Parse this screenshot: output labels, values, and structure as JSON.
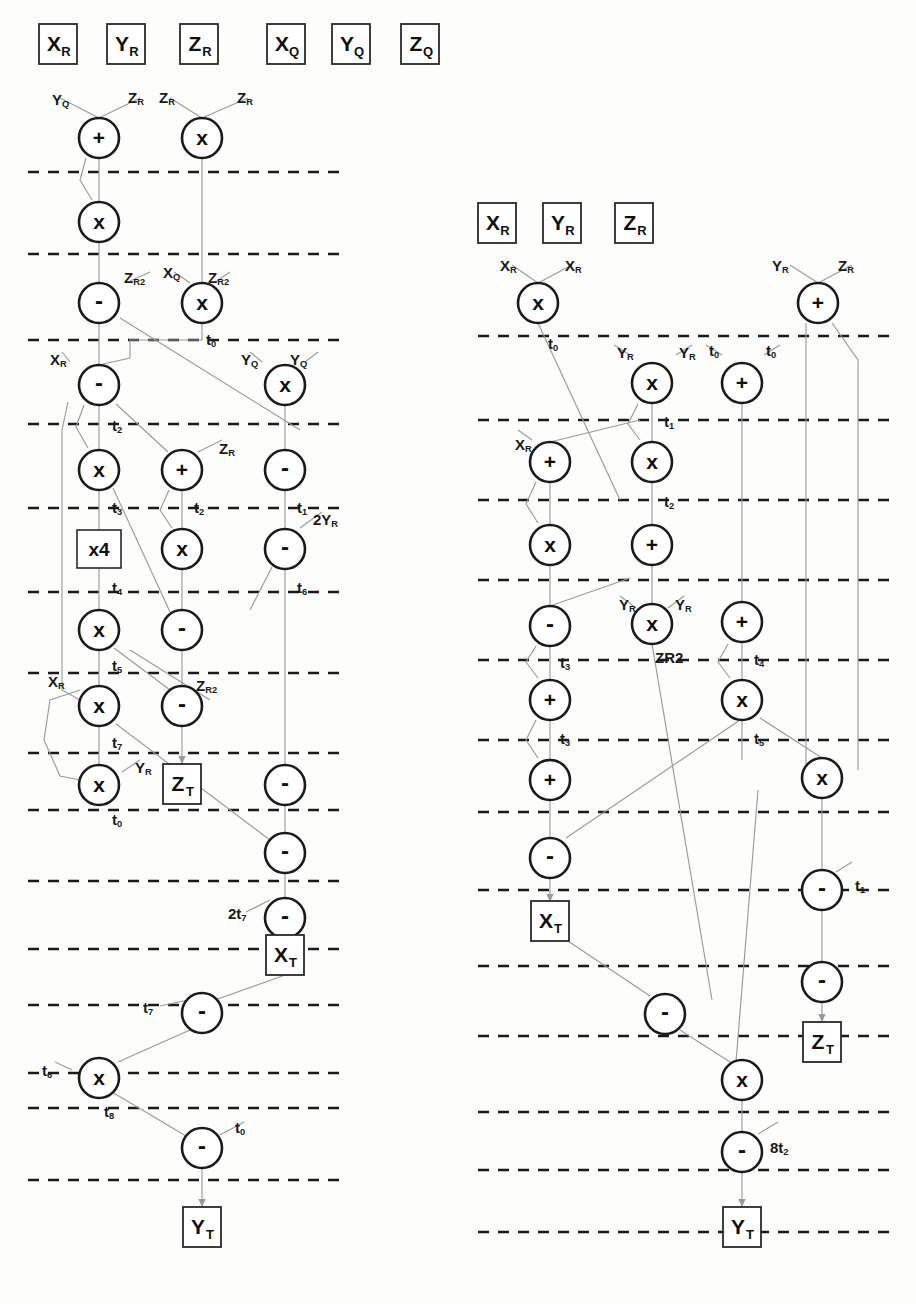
{
  "meta": {
    "colors": {
      "ink": "#1a1a1a",
      "wire": "#8a8a8a",
      "dash": "#1a1a1a",
      "paper": "#fdfdfc"
    }
  },
  "operators": {
    "add": "+",
    "mul": "x",
    "sub": "-",
    "times4": "x4"
  },
  "left_diagram": {
    "name": "left-dataflow-graph",
    "input_registers": [
      {
        "id": "L-in-XR",
        "label": "X",
        "sub": "R",
        "cx": 58,
        "cy": 44
      },
      {
        "id": "L-in-YR",
        "label": "Y",
        "sub": "R",
        "cx": 126,
        "cy": 44
      },
      {
        "id": "L-in-ZR",
        "label": "Z",
        "sub": "R",
        "cx": 199,
        "cy": 44
      },
      {
        "id": "L-in-XQ",
        "label": "X",
        "sub": "Q",
        "cx": 286,
        "cy": 44
      },
      {
        "id": "L-in-YQ",
        "label": "Y",
        "sub": "Q",
        "cx": 351,
        "cy": 44
      },
      {
        "id": "L-in-ZQ",
        "label": "Z",
        "sub": "Q",
        "cx": 420,
        "cy": 44
      }
    ],
    "dashed_rows": [
      172,
      254,
      340,
      424,
      508,
      592,
      673,
      753,
      810,
      881,
      949,
      1005,
      1073,
      1108,
      1180
    ],
    "dash_x0": 28,
    "dash_x1": 345,
    "nodes": [
      {
        "id": "L1",
        "op": "+",
        "cx": 99,
        "cy": 138
      },
      {
        "id": "L2",
        "op": "x",
        "cx": 202,
        "cy": 138
      },
      {
        "id": "L3",
        "op": "x",
        "cx": 99,
        "cy": 222
      },
      {
        "id": "L4",
        "op": "-",
        "cx": 99,
        "cy": 303
      },
      {
        "id": "L5",
        "op": "x",
        "cx": 202,
        "cy": 303
      },
      {
        "id": "L6",
        "op": "-",
        "cx": 99,
        "cy": 385
      },
      {
        "id": "L7",
        "op": "x",
        "cx": 285,
        "cy": 385
      },
      {
        "id": "L8",
        "op": "x",
        "cx": 99,
        "cy": 470
      },
      {
        "id": "L9",
        "op": "+",
        "cx": 182,
        "cy": 470
      },
      {
        "id": "L10",
        "op": "-",
        "cx": 285,
        "cy": 470
      },
      {
        "id": "L11",
        "op": "x4",
        "cx": 99,
        "cy": 549,
        "shape": "box"
      },
      {
        "id": "L12",
        "op": "x",
        "cx": 182,
        "cy": 549
      },
      {
        "id": "L13",
        "op": "-",
        "cx": 285,
        "cy": 549
      },
      {
        "id": "L14",
        "op": "x",
        "cx": 99,
        "cy": 630
      },
      {
        "id": "L15",
        "op": "-",
        "cx": 182,
        "cy": 630
      },
      {
        "id": "L16",
        "op": "x",
        "cx": 99,
        "cy": 706
      },
      {
        "id": "L17",
        "op": "-",
        "cx": 182,
        "cy": 706
      },
      {
        "id": "L18",
        "op": "x",
        "cx": 99,
        "cy": 785
      },
      {
        "id": "L19",
        "op": "-",
        "cx": 285,
        "cy": 785
      },
      {
        "id": "L20",
        "op": "-",
        "cx": 285,
        "cy": 853
      },
      {
        "id": "L21",
        "op": "-",
        "cx": 285,
        "cy": 918
      },
      {
        "id": "L22",
        "op": "-",
        "cx": 202,
        "cy": 1013
      },
      {
        "id": "L23",
        "op": "x",
        "cx": 99,
        "cy": 1078
      },
      {
        "id": "L24",
        "op": "-",
        "cx": 202,
        "cy": 1148
      }
    ],
    "output_registers": [
      {
        "id": "L-out-ZT",
        "label": "Z",
        "sub": "T",
        "cx": 182,
        "cy": 784
      },
      {
        "id": "L-out-XT",
        "label": "X",
        "sub": "T",
        "cx": 285,
        "cy": 955
      },
      {
        "id": "L-out-YT",
        "label": "Y",
        "sub": "T",
        "cx": 202,
        "cy": 1227
      }
    ],
    "wire_labels": [
      {
        "text": "Y",
        "sub": "Q",
        "x": 52,
        "y": 92
      },
      {
        "text": "Z",
        "sub": "R",
        "x": 128,
        "y": 90
      },
      {
        "text": "Z",
        "sub": "R",
        "x": 159,
        "y": 90
      },
      {
        "text": "Z",
        "sub": "R",
        "x": 237,
        "y": 90
      },
      {
        "text": "Z",
        "sub": "R2",
        "x": 124,
        "y": 270
      },
      {
        "text": "X",
        "sub": "Q",
        "x": 163,
        "y": 265
      },
      {
        "text": "Z",
        "sub": "R2",
        "x": 208,
        "y": 270
      },
      {
        "text": "t",
        "sub": "0",
        "x": 206,
        "y": 332
      },
      {
        "text": "X",
        "sub": "R",
        "x": 50,
        "y": 352
      },
      {
        "text": "Y",
        "sub": "Q",
        "x": 241,
        "y": 352
      },
      {
        "text": "Y",
        "sub": "Q",
        "x": 290,
        "y": 352
      },
      {
        "text": "t",
        "sub": "2",
        "x": 112,
        "y": 418
      },
      {
        "text": "Z",
        "sub": "R",
        "x": 219,
        "y": 441
      },
      {
        "text": "t",
        "sub": "3",
        "x": 112,
        "y": 500
      },
      {
        "text": "t",
        "sub": "2",
        "x": 194,
        "y": 500
      },
      {
        "text": "t",
        "sub": "1",
        "x": 297,
        "y": 500
      },
      {
        "text": "2Y",
        "sub": "R",
        "x": 313,
        "y": 512
      },
      {
        "text": "t",
        "sub": "4",
        "x": 112,
        "y": 580
      },
      {
        "text": "t",
        "sub": "6",
        "x": 297,
        "y": 580
      },
      {
        "text": "t",
        "sub": "5",
        "x": 112,
        "y": 658
      },
      {
        "text": "X",
        "sub": "R",
        "x": 48,
        "y": 674
      },
      {
        "text": "Z",
        "sub": "R2",
        "x": 196,
        "y": 678
      },
      {
        "text": "t",
        "sub": "7",
        "x": 112,
        "y": 735
      },
      {
        "text": "Y",
        "sub": "R",
        "x": 135,
        "y": 760
      },
      {
        "text": "t",
        "sub": "0",
        "x": 112,
        "y": 812
      },
      {
        "text": "2t",
        "sub": "7",
        "x": 228,
        "y": 906
      },
      {
        "text": "t",
        "sub": "7",
        "x": 143,
        "y": 1000
      },
      {
        "text": "t",
        "sub": "6",
        "x": 42,
        "y": 1063
      },
      {
        "text": "t",
        "sub": "8",
        "x": 104,
        "y": 1104
      },
      {
        "text": "t",
        "sub": "0",
        "x": 235,
        "y": 1120
      }
    ]
  },
  "right_diagram": {
    "name": "right-dataflow-graph",
    "input_registers": [
      {
        "id": "R-in-XR",
        "label": "X",
        "sub": "R",
        "cx": 497,
        "cy": 223
      },
      {
        "id": "R-in-YR",
        "label": "Y",
        "sub": "R",
        "cx": 562,
        "cy": 223
      },
      {
        "id": "R-in-ZR",
        "label": "Z",
        "sub": "R",
        "cx": 634,
        "cy": 223
      }
    ],
    "dashed_rows": [
      336,
      420,
      500,
      580,
      660,
      740,
      812,
      890,
      966,
      1036,
      1112,
      1170,
      1232
    ],
    "dash_x0": 478,
    "dash_x1": 892,
    "nodes": [
      {
        "id": "R1",
        "op": "x",
        "cx": 538,
        "cy": 303
      },
      {
        "id": "R2",
        "op": "+",
        "cx": 818,
        "cy": 303
      },
      {
        "id": "R3",
        "op": "x",
        "cx": 652,
        "cy": 383
      },
      {
        "id": "R4",
        "op": "+",
        "cx": 742,
        "cy": 383
      },
      {
        "id": "R5",
        "op": "+",
        "cx": 550,
        "cy": 462
      },
      {
        "id": "R6",
        "op": "x",
        "cx": 652,
        "cy": 462
      },
      {
        "id": "R7",
        "op": "x",
        "cx": 550,
        "cy": 545
      },
      {
        "id": "R8",
        "op": "+",
        "cx": 652,
        "cy": 545
      },
      {
        "id": "R9",
        "op": "-",
        "cx": 550,
        "cy": 626
      },
      {
        "id": "R10",
        "op": "x",
        "cx": 652,
        "cy": 624
      },
      {
        "id": "R11",
        "op": "+",
        "cx": 742,
        "cy": 622
      },
      {
        "id": "R12",
        "op": "+",
        "cx": 550,
        "cy": 700
      },
      {
        "id": "R13",
        "op": "x",
        "cx": 742,
        "cy": 700
      },
      {
        "id": "R14",
        "op": "+",
        "cx": 550,
        "cy": 780
      },
      {
        "id": "R15",
        "op": "x",
        "cx": 822,
        "cy": 778
      },
      {
        "id": "R16",
        "op": "-",
        "cx": 550,
        "cy": 858
      },
      {
        "id": "R17",
        "op": "-",
        "cx": 822,
        "cy": 890
      },
      {
        "id": "R18",
        "op": "-",
        "cx": 822,
        "cy": 982
      },
      {
        "id": "R19",
        "op": "-",
        "cx": 665,
        "cy": 1014
      },
      {
        "id": "R20",
        "op": "x",
        "cx": 742,
        "cy": 1080
      },
      {
        "id": "R21",
        "op": "-",
        "cx": 742,
        "cy": 1152
      }
    ],
    "output_registers": [
      {
        "id": "R-out-XT",
        "label": "X",
        "sub": "T",
        "cx": 550,
        "cy": 921
      },
      {
        "id": "R-out-ZT",
        "label": "Z",
        "sub": "T",
        "cx": 822,
        "cy": 1042
      },
      {
        "id": "R-out-YT",
        "label": "Y",
        "sub": "T",
        "cx": 742,
        "cy": 1227
      }
    ],
    "wire_labels": [
      {
        "text": "X",
        "sub": "R",
        "x": 500,
        "y": 258
      },
      {
        "text": "X",
        "sub": "R",
        "x": 565,
        "y": 258
      },
      {
        "text": "Y",
        "sub": "R",
        "x": 772,
        "y": 258
      },
      {
        "text": "Z",
        "sub": "R",
        "x": 838,
        "y": 258
      },
      {
        "text": "t",
        "sub": "0",
        "x": 548,
        "y": 336
      },
      {
        "text": "Y",
        "sub": "R",
        "x": 617,
        "y": 345
      },
      {
        "text": "Y",
        "sub": "R",
        "x": 679,
        "y": 345
      },
      {
        "text": "t",
        "sub": "0",
        "x": 709,
        "y": 343
      },
      {
        "text": "t",
        "sub": "0",
        "x": 766,
        "y": 343
      },
      {
        "text": "t",
        "sub": "1",
        "x": 664,
        "y": 414
      },
      {
        "text": "X",
        "sub": "R",
        "x": 515,
        "y": 437
      },
      {
        "text": "t",
        "sub": "2",
        "x": 664,
        "y": 494
      },
      {
        "text": "Y",
        "sub": "R",
        "x": 619,
        "y": 597
      },
      {
        "text": "Y",
        "sub": "R",
        "x": 675,
        "y": 597
      },
      {
        "text": "t",
        "sub": "3",
        "x": 560,
        "y": 655
      },
      {
        "text": "ZR2",
        "sub": "",
        "x": 655,
        "y": 650
      },
      {
        "text": "t",
        "sub": "4",
        "x": 754,
        "y": 652
      },
      {
        "text": "t",
        "sub": "3",
        "x": 560,
        "y": 731
      },
      {
        "text": "t",
        "sub": "5",
        "x": 754,
        "y": 731
      },
      {
        "text": "t",
        "sub": "1",
        "x": 855,
        "y": 878
      },
      {
        "text": "8t",
        "sub": "2",
        "x": 770,
        "y": 1140
      }
    ]
  }
}
